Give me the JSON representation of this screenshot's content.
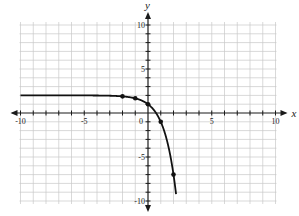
{
  "chart_data": {
    "type": "line",
    "title": "",
    "xlabel": "x",
    "ylabel": "y",
    "xlim": [
      -10,
      10
    ],
    "ylim": [
      -10,
      10
    ],
    "grid": true,
    "x_ticks": [
      {
        "value": -10,
        "label": "-10"
      },
      {
        "value": -5,
        "label": "-5"
      },
      {
        "value": 0,
        "label": "0"
      },
      {
        "value": 5,
        "label": "5"
      },
      {
        "value": 10,
        "label": "10"
      }
    ],
    "y_ticks": [
      {
        "value": 10,
        "label": "10"
      },
      {
        "value": 5,
        "label": "5"
      },
      {
        "value": -5,
        "label": "-5"
      },
      {
        "value": -10,
        "label": "-10"
      }
    ],
    "series": [
      {
        "name": "y = 2 - 3^x",
        "function": "2 - 3^x",
        "x_range": [
          -10,
          2.2
        ],
        "marked_points": [
          {
            "x": -2,
            "y": 1.89
          },
          {
            "x": -1,
            "y": 1.67
          },
          {
            "x": 0,
            "y": 1
          },
          {
            "x": 1,
            "y": -1
          },
          {
            "x": 2,
            "y": -7
          }
        ]
      }
    ]
  }
}
